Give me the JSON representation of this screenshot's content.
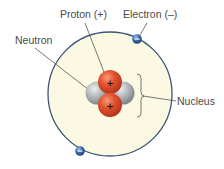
{
  "diagram": {
    "labels": {
      "proton": "Proton (+)",
      "electron": "Electron (–)",
      "neutron": "Neutron",
      "nucleus": "Nucleus"
    },
    "proton_charge_symbol": "+",
    "electron_charge_symbol": "–",
    "particles": {
      "protons": 2,
      "neutrons": 2,
      "electrons": 2
    },
    "colors": {
      "orbit_fill": "#fbf9e3",
      "orbit_stroke": "#3a5573",
      "proton": "#e0502e",
      "neutron": "#a7abae",
      "electron": "#3a6cb0",
      "leader_line": "#555555",
      "label_text": "#4a4a4a"
    }
  }
}
